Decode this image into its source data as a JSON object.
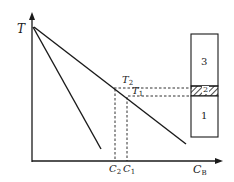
{
  "diagram": {
    "type": "phase-diagram-zone-refining",
    "axes": {
      "y_label": "T",
      "x_label_main": "C",
      "x_label_sub": "B"
    },
    "lines": {
      "liquidus": "shallow line from top-left to lower-right",
      "solidus": "steep line from top-left"
    },
    "temperatures": [
      {
        "main": "T",
        "sub": "2"
      },
      {
        "main": "T",
        "sub": "1"
      }
    ],
    "concentrations": [
      {
        "main": "C",
        "sub": "2"
      },
      {
        "main": "C",
        "sub": "1"
      }
    ],
    "rod_zones": [
      {
        "label": "3",
        "kind": "solid-top"
      },
      {
        "label": "2",
        "kind": "molten-zone-hatched"
      },
      {
        "label": "1",
        "kind": "solid-bottom"
      }
    ],
    "colors": {
      "ink": "#1a1a1a",
      "background": "#ffffff"
    }
  }
}
